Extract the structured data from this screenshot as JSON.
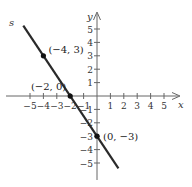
{
  "chart_data": {
    "type": "line",
    "title": "",
    "xlabel": "x",
    "ylabel": "y",
    "xlim": [
      -5,
      5
    ],
    "ylim": [
      -5,
      5
    ],
    "grid": false,
    "x_ticks": [
      -5,
      -4,
      -3,
      -2,
      -1,
      1,
      2,
      3,
      4,
      5
    ],
    "y_ticks": [
      -5,
      -4,
      -3,
      -2,
      -1,
      1,
      2,
      3,
      4,
      5
    ],
    "x_tick_labels": [
      "−5",
      "−4",
      "−3",
      "−2",
      "−1",
      "1",
      "2",
      "3",
      "4",
      "5"
    ],
    "y_tick_labels": [
      "−5",
      "−4",
      "−3",
      "−2",
      "−1",
      "1",
      "2",
      "3",
      "4",
      "5"
    ],
    "series": [
      {
        "name": "s",
        "equation": "y = -3/2 x - 3",
        "x": [
          -5.5,
          1.6
        ],
        "y": [
          5.25,
          -5.4
        ]
      }
    ],
    "points": [
      {
        "x": -4,
        "y": 3,
        "label": "(−4, 3)"
      },
      {
        "x": -2,
        "y": 0,
        "label": "(−2, 0)"
      },
      {
        "x": 0,
        "y": -3,
        "label": "(0, −3)"
      }
    ],
    "line_label": "s",
    "colors": {
      "line": "#2a2a2a",
      "axis": "#555555",
      "text": "#333333"
    }
  }
}
